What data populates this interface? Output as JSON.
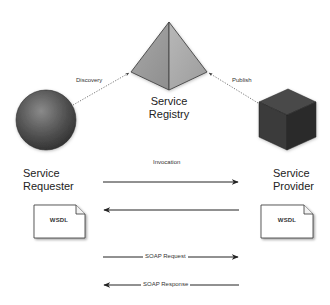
{
  "diagram": {
    "nodes": {
      "registry": {
        "label_line1": "Service",
        "label_line2": "Registry",
        "shape": "pyramid-icon",
        "color": "#9a9a9a"
      },
      "requester": {
        "label_line1": "Service",
        "label_line2": "Requester",
        "shape": "sphere-icon",
        "color": "#555555"
      },
      "provider": {
        "label_line1": "Service",
        "label_line2": "Provider",
        "shape": "cube-icon",
        "color": "#333333"
      }
    },
    "edges": {
      "discovery": "Discovery",
      "publish": "Publish",
      "invocation": "Invocation",
      "soap_request": "SOAP Request",
      "soap_response": "SOAP Response"
    },
    "documents": {
      "requester_wsdl": "WSDL",
      "provider_wsdl": "WSDL"
    }
  }
}
